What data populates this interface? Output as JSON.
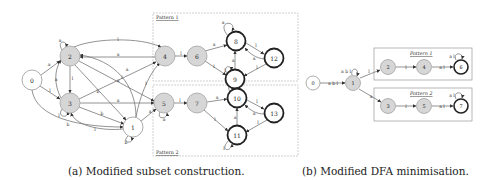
{
  "figure": {
    "subfigure_a": {
      "caption": "(a) Modified subset construction.",
      "pattern_labels": [
        "Pattern 1",
        "Pattern 2"
      ],
      "nodes": [
        {
          "id": "0",
          "x": 32,
          "y": 80,
          "style": "initial"
        },
        {
          "id": "2",
          "x": 70,
          "y": 56,
          "style": "shaded"
        },
        {
          "id": "3",
          "x": 70,
          "y": 103,
          "style": "shaded"
        },
        {
          "id": "1",
          "x": 133,
          "y": 127,
          "style": "plain"
        },
        {
          "id": "4",
          "x": 165,
          "y": 56,
          "style": "shaded"
        },
        {
          "id": "6",
          "x": 197,
          "y": 56,
          "style": "shaded"
        },
        {
          "id": "8",
          "x": 236,
          "y": 41,
          "style": "accepting"
        },
        {
          "id": "9",
          "x": 235,
          "y": 79,
          "style": "accepting"
        },
        {
          "id": "12",
          "x": 274,
          "y": 58,
          "style": "accepting"
        },
        {
          "id": "5",
          "x": 164,
          "y": 103,
          "style": "shaded"
        },
        {
          "id": "7",
          "x": 197,
          "y": 103,
          "style": "shaded"
        },
        {
          "id": "10",
          "x": 237,
          "y": 98,
          "style": "accepting"
        },
        {
          "id": "13",
          "x": 274,
          "y": 113,
          "style": "accepting"
        },
        {
          "id": "11",
          "x": 237,
          "y": 135,
          "style": "accepting"
        }
      ],
      "edge_labels": {
        "e02": "a",
        "e03": "l",
        "e01": "b",
        "e22": "a",
        "e23": "l",
        "e32": "a",
        "e33": "l",
        "e24": "l",
        "e42": "a",
        "e25": "a",
        "e21": "b",
        "e34": "l",
        "e35": "a",
        "e31": "b",
        "e13": "l",
        "e11": "b",
        "e14": "l",
        "e15": "a",
        "e12": "a",
        "e46": "l",
        "e68": "a",
        "e69": "l",
        "e88": "a",
        "e812": "l",
        "e128": "a",
        "e99": "l",
        "e98": "a",
        "e912": "l",
        "e55": "a",
        "e57": "l",
        "e710": "a",
        "e711": "l",
        "e1010": "a",
        "e1013": "l",
        "e1310": "a",
        "e1111": "l",
        "e1110": "a",
        "e1311": "l"
      }
    },
    "subfigure_b": {
      "caption": "(b) Modified DFA minimisation.",
      "pattern_labels": [
        "Pattern 1",
        "Pattern 2"
      ],
      "nodes": [
        {
          "id": "0",
          "x": 313,
          "y": 83,
          "style": "initial"
        },
        {
          "id": "1",
          "x": 353,
          "y": 83,
          "style": "shaded"
        },
        {
          "id": "2",
          "x": 388,
          "y": 67,
          "style": "shaded"
        },
        {
          "id": "4",
          "x": 424,
          "y": 67,
          "style": "shaded"
        },
        {
          "id": "6",
          "x": 461,
          "y": 67,
          "style": "accepting"
        },
        {
          "id": "3",
          "x": 388,
          "y": 106,
          "style": "shaded"
        },
        {
          "id": "5",
          "x": 424,
          "y": 106,
          "style": "shaded"
        },
        {
          "id": "7",
          "x": 461,
          "y": 106,
          "style": "accepting"
        }
      ],
      "edge_labels": {
        "e01": "a b l",
        "e11": "a b l",
        "e12": "l",
        "e13": "a",
        "e24": "l",
        "e46": "a l",
        "e66": "a l",
        "e35": "l",
        "e57": "a l",
        "e77": "a l"
      }
    }
  },
  "colors": {
    "shaded_fill": "#d6d6d6",
    "node_stroke": "#555555",
    "edge": "#777777",
    "box": "#bbbbbb"
  }
}
